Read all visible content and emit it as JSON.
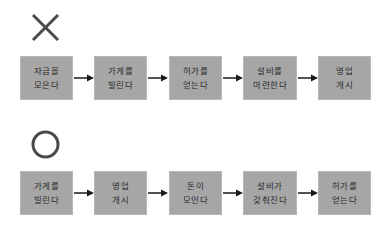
{
  "wrong_flow": {
    "symbol": "x-mark-icon",
    "steps": [
      {
        "line1": "자금을",
        "line2": "모은다"
      },
      {
        "line1": "가게를",
        "line2": "빌린다"
      },
      {
        "line1": "허가를",
        "line2": "얻는다"
      },
      {
        "line1": "설비를",
        "line2": "마련한다"
      },
      {
        "line1": "영업",
        "line2": "개시"
      }
    ]
  },
  "right_flow": {
    "symbol": "circle-mark-icon",
    "steps": [
      {
        "line1": "가게를",
        "line2": "빌린다"
      },
      {
        "line1": "영업",
        "line2": "개시"
      },
      {
        "line1": "돈이",
        "line2": "모인다"
      },
      {
        "line1": "설비가",
        "line2": "갖춰진다"
      },
      {
        "line1": "허가를",
        "line2": "얻는다"
      }
    ]
  },
  "colors": {
    "box": "#a6a6a6",
    "symbol": "#4a4a4a",
    "arrow": "#1a1a1a"
  }
}
